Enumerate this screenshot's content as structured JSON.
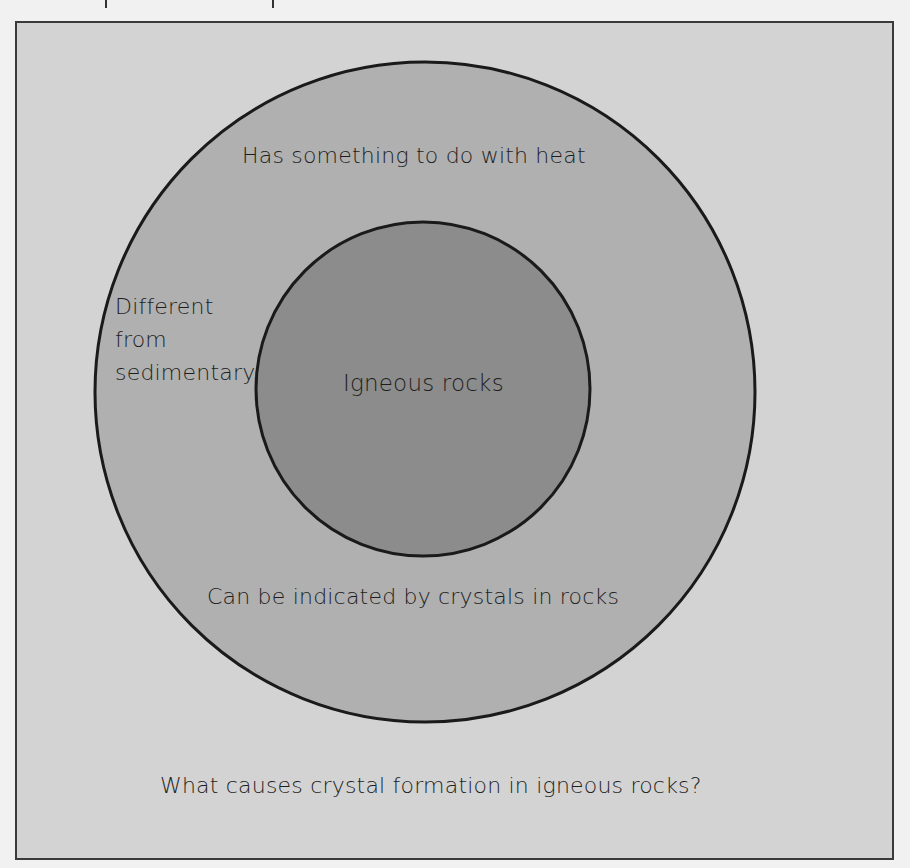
{
  "diagram": {
    "type": "concentric-circle-map",
    "center_label": "Igneous rocks",
    "ring_labels": {
      "top": "Has something to do with heat",
      "left": [
        "Different",
        "from",
        "sedimentary"
      ],
      "bottom": "Can be indicated by crystals in rocks"
    },
    "question": "What causes crystal formation in igneous rocks?"
  },
  "colors": {
    "page_background": "#f1f1f1",
    "frame_fill": "#d3d3d3",
    "outer_circle_fill": "#b0b0b0",
    "inner_circle_fill": "#8c8c8c",
    "stroke": "#1a1a1a"
  }
}
